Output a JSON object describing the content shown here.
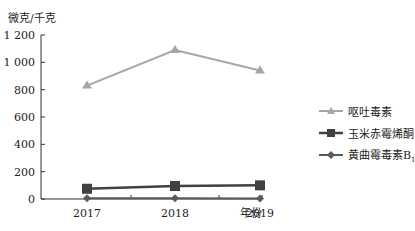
{
  "chart_data": {
    "type": "line",
    "title": "",
    "xlabel": "年份",
    "ylabel": "微克/千克",
    "categories": [
      "2017",
      "2018",
      "2019"
    ],
    "yticks": [
      "0",
      "200",
      "400",
      "600",
      "800",
      "1 000",
      "1 200"
    ],
    "ylim": [
      0,
      1200
    ],
    "grid": false,
    "legend_position": "right",
    "series": [
      {
        "name": "呕吐毒素",
        "marker": "triangle",
        "color": "#a6a6a6",
        "values": [
          830,
          1090,
          940
        ]
      },
      {
        "name": "玉米赤霉烯酮",
        "marker": "square",
        "color": "#404040",
        "values": [
          75,
          95,
          100
        ]
      },
      {
        "name": "黄曲霉毒素B1",
        "marker": "diamond",
        "color": "#5a5a5a",
        "values": [
          5,
          5,
          3
        ]
      }
    ]
  },
  "labels": {
    "y_unit": "微克/千克",
    "x_unit": "年份",
    "legend": [
      "呕吐毒素",
      "玉米赤霉烯酮",
      "黄曲霉毒素B"
    ],
    "legend_sub": "1"
  }
}
